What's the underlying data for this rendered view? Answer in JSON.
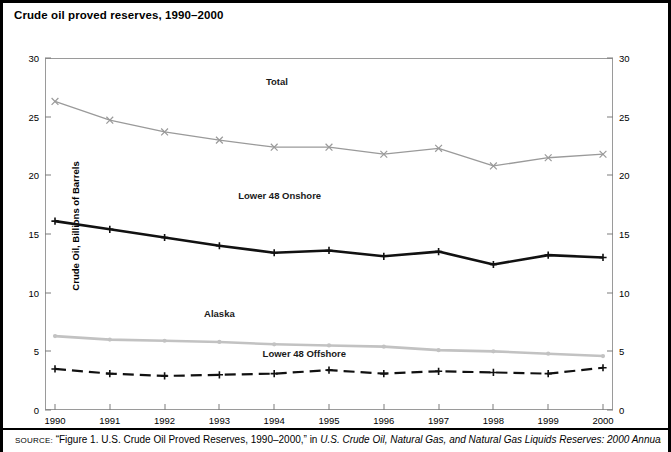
{
  "title": "Crude oil proved reserves, 1990–2000",
  "ylabel": "Crude Oil, Billions of Barrels",
  "source": {
    "prefix": "SOURCE:",
    "quoted": "“Figure 1. U.S. Crude Oil Proved Reserves, 1990–2000,” in ",
    "italic": "U.S. Crude Oil, Natural Gas, and Natural Gas Liquids Reserves: 2000 Annual Report"
  },
  "labels": {
    "total": "Total",
    "onshore": "Lower 48 Onshore",
    "alaska": "Alaska",
    "offshore": "Lower 48 Offshore"
  },
  "colors": {
    "total": "#9a9a9a",
    "onshore": "#111111",
    "alaska": "#c2c2c2",
    "offshore": "#111111",
    "frame": "#9a9a9a",
    "text": "#000000"
  },
  "chart_data": {
    "type": "line",
    "title": "Crude oil proved reserves, 1990–2000",
    "xlabel": "",
    "ylabel": "Crude Oil, Billions of Barrels",
    "ylim": [
      0,
      30
    ],
    "yticks": [
      0,
      5,
      10,
      15,
      20,
      25,
      30
    ],
    "grid": false,
    "legend": "inline-annotations",
    "dual_y_axis": true,
    "categories": [
      1990,
      1991,
      1992,
      1993,
      1994,
      1995,
      1996,
      1997,
      1998,
      1999,
      2000
    ],
    "series": [
      {
        "name": "Total",
        "marker": "x",
        "style": "solid",
        "color": "#9a9a9a",
        "values": [
          26.3,
          24.7,
          23.7,
          23.0,
          22.4,
          22.4,
          21.8,
          22.3,
          20.8,
          21.5,
          21.8
        ]
      },
      {
        "name": "Lower 48 Onshore",
        "marker": "plus",
        "style": "solid",
        "color": "#111111",
        "values": [
          16.1,
          15.4,
          14.7,
          14.0,
          13.4,
          13.6,
          13.1,
          13.5,
          12.4,
          13.2,
          13.0
        ]
      },
      {
        "name": "Alaska",
        "marker": "dot",
        "style": "solid",
        "color": "#c2c2c2",
        "values": [
          6.3,
          6.0,
          5.9,
          5.8,
          5.6,
          5.5,
          5.4,
          5.1,
          5.0,
          4.8,
          4.6
        ]
      },
      {
        "name": "Lower 48 Offshore",
        "marker": "plus",
        "style": "dashed",
        "color": "#111111",
        "values": [
          3.5,
          3.1,
          2.9,
          3.0,
          3.1,
          3.4,
          3.1,
          3.3,
          3.2,
          3.1,
          3.6
        ]
      }
    ]
  }
}
